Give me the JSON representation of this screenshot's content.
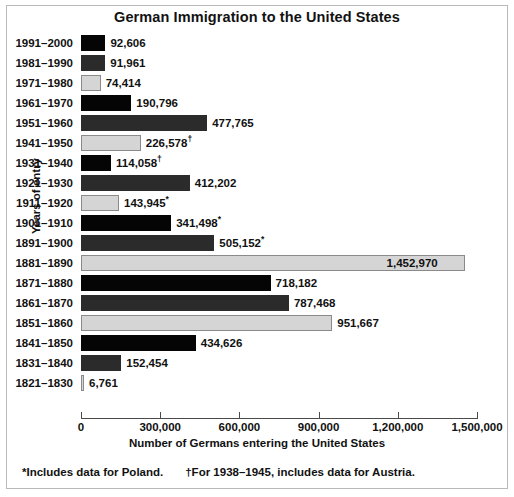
{
  "chart_data": {
    "type": "bar",
    "orientation": "horizontal",
    "title": "German Immigration to the United States",
    "xlabel": "Number of Germans entering the United States",
    "ylabel": "Years of entry",
    "xlim": [
      0,
      1500000
    ],
    "xticks": [
      0,
      300000,
      600000,
      900000,
      1200000,
      1500000
    ],
    "xtick_labels": [
      "0",
      "300,000",
      "600,000",
      "900,000",
      "1,200,000",
      "1,500,000"
    ],
    "grid": false,
    "legend": "none",
    "categories": [
      "1991–2000",
      "1981–1990",
      "1971–1980",
      "1961–1970",
      "1951–1960",
      "1941–1950",
      "1931–1940",
      "1921–1930",
      "1911–1920",
      "1901–1910",
      "1891–1900",
      "1881–1890",
      "1871–1880",
      "1861–1870",
      "1851–1860",
      "1841–1850",
      "1831–1840",
      "1821–1830"
    ],
    "values": [
      92606,
      91961,
      74414,
      190796,
      477765,
      226578,
      114058,
      412202,
      143945,
      341498,
      505152,
      1452970,
      718182,
      787468,
      951667,
      434626,
      152454,
      6761
    ],
    "value_labels": [
      "92,606",
      "91,961",
      "74,414",
      "190,796",
      "477,765",
      "226,578",
      "114,058",
      "412,202",
      "143,945",
      "341,498",
      "505,152",
      "1,452,970",
      "718,182",
      "787,468",
      "951,667",
      "434,626",
      "152,454",
      "6,761"
    ],
    "value_marks": [
      "",
      "",
      "",
      "",
      "",
      "†",
      "†",
      "",
      "*",
      "*",
      "*",
      "",
      "",
      "",
      "",
      "",
      "",
      ""
    ],
    "bar_colors": [
      "#050505",
      "#2b2b2b",
      "#d5d5d5",
      "#050505",
      "#2b2b2b",
      "#d5d5d5",
      "#050505",
      "#2b2b2b",
      "#d5d5d5",
      "#050505",
      "#2b2b2b",
      "#d5d5d5",
      "#050505",
      "#2b2b2b",
      "#d5d5d5",
      "#050505",
      "#2b2b2b",
      "#d5d5d5"
    ],
    "palette": {
      "black": "#050505",
      "dark_gray": "#2b2b2b",
      "light_gray": "#d5d5d5",
      "light_gray_border": "#8a8a8a",
      "axis": "#4a4a4a",
      "frame": "#b9b9b9",
      "background": "#ffffff",
      "text": "#111111"
    }
  },
  "footnotes": {
    "asterisk": "*Includes data for Poland.",
    "dagger": "†For 1938–1945, includes data for Austria."
  }
}
